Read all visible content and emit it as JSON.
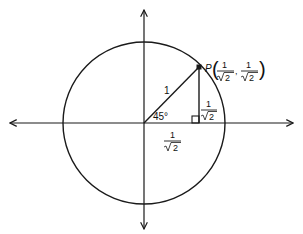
{
  "diagram": {
    "colors": {
      "stroke": "#1a1a1a",
      "background": "#ffffff"
    },
    "point": {
      "letter": "P",
      "x_num": "1",
      "x_den": "2",
      "y_num": "1",
      "y_den": "2",
      "separator": ","
    },
    "labels": {
      "hypotenuse": "1",
      "angle": "45°",
      "vertical_num": "1",
      "vertical_den": "2",
      "horizontal_num": "1",
      "horizontal_den": "2"
    }
  }
}
